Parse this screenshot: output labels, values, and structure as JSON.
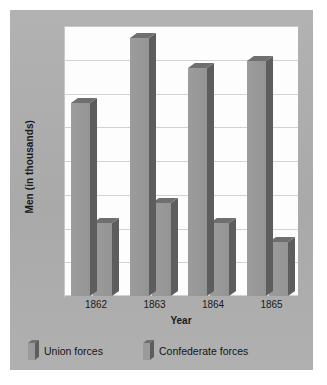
{
  "chart_data": {
    "type": "bar",
    "title": "",
    "subtitle": "",
    "xlabel": "Year",
    "ylabel": "Men (in thousands)",
    "categories": [
      "1862",
      "1863",
      "1864",
      "1865"
    ],
    "series": [
      {
        "name": "Union forces",
        "values": [
          500,
          670,
          590,
          610
        ]
      },
      {
        "name": "Confederate forces",
        "values": [
          190,
          240,
          190,
          140
        ]
      }
    ],
    "ylim": [
      0,
      700
    ],
    "yticks": [
      0,
      100,
      200,
      300,
      400,
      500,
      600,
      700
    ],
    "ytick_labels_visible": false,
    "grid": true,
    "grid_lines": 8,
    "legend_position": "bottom-left",
    "style": "3d-bar",
    "colors": {
      "bar_face": "#989898",
      "bar_side": "#5d5d5d",
      "bar_top": "#6f6f6f",
      "panel_background": "#aeaeae",
      "plot_background": "#fdfdfd",
      "gridline": "#d2d2d2",
      "text": "#1a1a1a"
    }
  },
  "axes": {
    "y_label": "Men (in thousands)",
    "x_label": "Year",
    "x_tick_labels": [
      "1862",
      "1863",
      "1864",
      "1865"
    ]
  },
  "legend": {
    "items": [
      {
        "label": "Union forces",
        "swatch": "bar-swatch-icon"
      },
      {
        "label": "Confederate forces",
        "swatch": "bar-swatch-icon"
      }
    ]
  }
}
